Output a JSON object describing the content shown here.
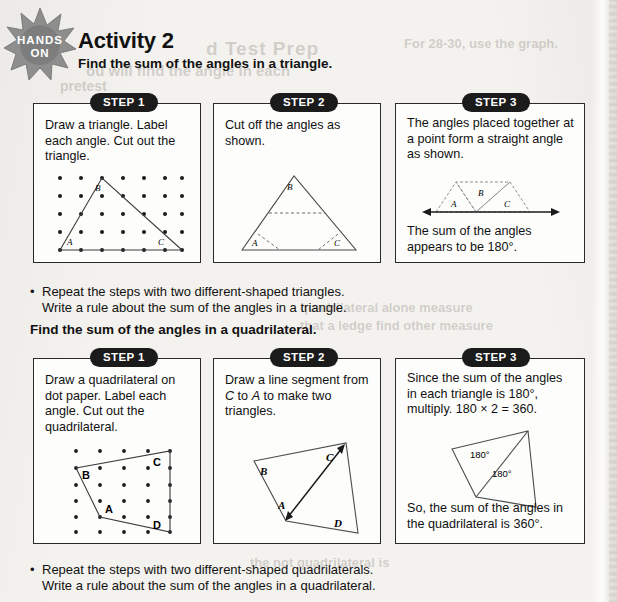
{
  "badge": {
    "line1": "HANDS",
    "line2": "ON",
    "name": "hands-on-badge"
  },
  "header": {
    "title": "Activity 2",
    "subtitle_triangle": "Find the sum of the angles in a triangle.",
    "subtitle_quadrilateral": "Find the sum of the angles in a quadrilateral."
  },
  "bullets": {
    "triangle": {
      "marker": "•",
      "line1": "Repeat the steps with two different-shaped triangles.",
      "line2": "Write a rule about the sum of the angles in a triangle."
    },
    "quadrilateral": {
      "marker": "•",
      "line1": "Repeat the steps with two different-shaped quadrilaterals.",
      "line2": "Write a rule about the sum of the angles in a quadrilateral."
    }
  },
  "triangle_section": {
    "steps": [
      {
        "badge": "STEP 1",
        "text": "Draw a triangle. Label each angle. Cut out the triangle.",
        "figure": "dot-paper-triangle",
        "vertex_labels": [
          "A",
          "B",
          "C"
        ],
        "grid_cols": 7,
        "grid_rows": 5
      },
      {
        "badge": "STEP 2",
        "text": "Cut off the angles as shown.",
        "figure": "triangle-with-cut-lines",
        "vertex_labels": [
          "A",
          "B",
          "C"
        ]
      },
      {
        "badge": "STEP 3",
        "text": "The angles placed together at a point form a straight angle as shown.",
        "text_below": "The sum of the angles appears to be 180°.",
        "figure": "angles-on-straight-line",
        "vertex_labels": [
          "A",
          "B",
          "C"
        ]
      }
    ]
  },
  "quadrilateral_section": {
    "steps": [
      {
        "badge": "STEP 1",
        "text": "Draw a quadrilateral on dot paper. Label each angle. Cut out the quadrilateral.",
        "figure": "dot-paper-quadrilateral",
        "vertex_labels": [
          "A",
          "B",
          "C",
          "D"
        ],
        "grid_cols": 5,
        "grid_rows": 6
      },
      {
        "badge": "STEP 2",
        "text_parts": [
          "Draw a line segment from ",
          "C",
          " to ",
          "A",
          " to make two triangles."
        ],
        "figure": "quadrilateral-with-diagonal",
        "vertex_labels": [
          "A",
          "B",
          "C",
          "D"
        ]
      },
      {
        "badge": "STEP 3",
        "text": "Since the sum of the angles in each triangle is 180°, multiply. 180 × 2 = 360.",
        "text_below": "So, the sum of the angles in the quadrilateral is 360°.",
        "figure": "quadrilateral-two-triangles",
        "angle_labels": [
          "180°",
          "180°"
        ]
      }
    ]
  },
  "bleed_through": {
    "t1": "d Test Prep",
    "t2": "For 28-30, use the graph.",
    "t3": "ou will find the angle in each",
    "t4": "pretest",
    "t5": "quadrilateral alone measure",
    "t6": "that a ledge find other measure",
    "t7": "the not quadrilateral is"
  },
  "colors": {
    "page_bg": "#f4f2ee",
    "box_bg": "#fdfdfc",
    "ink": "#111111",
    "badge_bg": "#1b1b1b",
    "badge_fg": "#ffffff",
    "starburst": "#8e8e8e",
    "figure_line": "#3a3a3a"
  }
}
